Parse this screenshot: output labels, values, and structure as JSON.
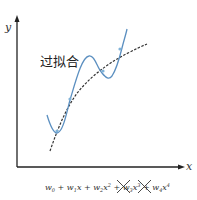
{
  "diagram": {
    "title_label": "过拟合",
    "axes": {
      "x_label": "x",
      "y_label": "y"
    },
    "formula": {
      "terms": [
        {
          "coef": "w",
          "sub": "0",
          "var": "",
          "pow": "",
          "crossed": false
        },
        {
          "coef": "w",
          "sub": "1",
          "var": "x",
          "pow": "",
          "crossed": false
        },
        {
          "coef": "w",
          "sub": "2",
          "var": "x",
          "pow": "2",
          "crossed": false
        },
        {
          "coef": "w",
          "sub": "3",
          "var": "x",
          "pow": "3",
          "crossed": true
        },
        {
          "coef": "w",
          "sub": "4",
          "var": "x",
          "pow": "4",
          "crossed": true
        }
      ],
      "text": "w0 + w1x + w2x^2 + w3x^3 + w4x^4"
    },
    "colors": {
      "overfit_curve": "#5b8fc0",
      "true_curve": "#333333",
      "axis": "#222222",
      "points": "#7fb2d8"
    },
    "series": [
      {
        "name": "overfit-curve",
        "style": "solid blue"
      },
      {
        "name": "true-trend-curve",
        "style": "dashed dark"
      }
    ],
    "data_points": [
      [
        57,
        131
      ],
      [
        70,
        99
      ],
      [
        103,
        71
      ],
      [
        120,
        49
      ]
    ]
  }
}
